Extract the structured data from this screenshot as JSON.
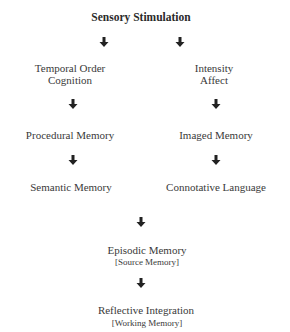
{
  "diagram": {
    "title": "Sensory Stimulation",
    "left_branch": {
      "node1_line1": "Temporal Order",
      "node1_line2": "Cognition",
      "node2": "Procedural Memory",
      "node3": "Semantic Memory"
    },
    "right_branch": {
      "node1_line1": "Intensity",
      "node1_line2": "Affect",
      "node2": "Imaged Memory",
      "node3": "Connotative Language"
    },
    "merge": {
      "node1": "Episodic Memory",
      "node1_sub": "[Source Memory]",
      "node2": "Reflective Integration",
      "node2_sub": "[Working Memory]"
    },
    "arrow_color": "#222222",
    "arrow_icon": "down-arrow-icon"
  }
}
